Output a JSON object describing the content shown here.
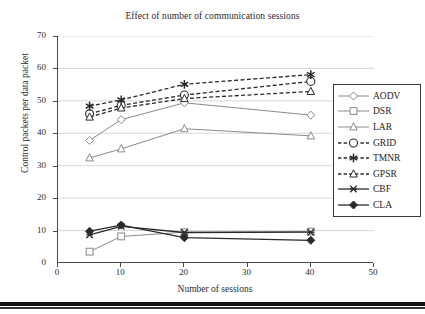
{
  "chart_data": {
    "type": "line",
    "title": "Effect of number of communication sessions",
    "xlabel": "Number of sessions",
    "ylabel": "Control packets per data packet",
    "x": [
      5,
      10,
      20,
      40
    ],
    "xlim": [
      0,
      50
    ],
    "ylim": [
      0,
      70
    ],
    "xticks": [
      "0",
      "10",
      "20",
      "30",
      "40",
      "50"
    ],
    "yticks": [
      "0",
      "10",
      "20",
      "30",
      "40",
      "50",
      "60",
      "70"
    ],
    "grid": true,
    "legend_position": "right-inside",
    "series": [
      {
        "name": "AODV",
        "marker": "diamond-open",
        "linestyle": "solid",
        "values": [
          37.8,
          44.2,
          49.4,
          45.6
        ]
      },
      {
        "name": "DSR",
        "marker": "square-open",
        "linestyle": "solid",
        "values": [
          3.5,
          8.2,
          9.5,
          9.7
        ]
      },
      {
        "name": "LAR",
        "marker": "triangle-open",
        "linestyle": "solid",
        "values": [
          32.4,
          35.2,
          41.4,
          39.2
        ]
      },
      {
        "name": "GRID",
        "marker": "circle-open",
        "linestyle": "dashed",
        "values": [
          46.0,
          48.6,
          51.8,
          56.0
        ]
      },
      {
        "name": "TMNR",
        "marker": "asterisk",
        "linestyle": "dashed",
        "values": [
          48.4,
          50.3,
          55.1,
          58.1
        ]
      },
      {
        "name": "GPSR",
        "marker": "triangle-open",
        "linestyle": "dashed",
        "values": [
          45.0,
          47.8,
          50.7,
          52.9
        ]
      },
      {
        "name": "CBF",
        "marker": "x-star",
        "linestyle": "solid",
        "values": [
          8.7,
          11.3,
          9.4,
          9.5
        ]
      },
      {
        "name": "CLA",
        "marker": "diamond-filled",
        "linestyle": "solid",
        "values": [
          9.8,
          11.7,
          7.8,
          7.0
        ]
      }
    ]
  },
  "legend": {
    "items": [
      {
        "label": "AODV"
      },
      {
        "label": "DSR"
      },
      {
        "label": "LAR"
      },
      {
        "label": "GRID"
      },
      {
        "label": "TMNR"
      },
      {
        "label": "GPSR"
      },
      {
        "label": "CBF"
      },
      {
        "label": "CLA"
      }
    ]
  },
  "colors": {
    "line_gray": "#8a8a8a",
    "line_dark": "#2a2a2a",
    "axis": "#4a4a4a",
    "grid": "#d8d8d8",
    "background": "#ffffff"
  }
}
